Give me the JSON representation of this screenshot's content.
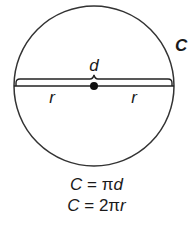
{
  "diagram": {
    "labels": {
      "circumference": "C",
      "diameter": "d",
      "radius_left": "r",
      "radius_right": "r"
    },
    "formulas": [
      {
        "lhs": "C",
        "eq": " = ",
        "rhs_num": "",
        "rhs_pi": "π",
        "rhs_var": "d"
      },
      {
        "lhs": "C",
        "eq": " = ",
        "rhs_num": "2",
        "rhs_pi": "π",
        "rhs_var": "r"
      }
    ],
    "colors": {
      "stroke": "#333333",
      "text": "#1a1a1a",
      "background": "#ffffff"
    }
  }
}
